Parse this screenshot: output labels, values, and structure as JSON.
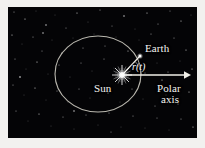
{
  "figure": {
    "background_color": "#040406",
    "frame_color": "#f2f1ef",
    "orbit_color": "#b9b7ae",
    "line_color": "#f0efe8",
    "star_color": "#ffffff"
  },
  "labels": {
    "earth": "Earth",
    "sun": "Sun",
    "polar": "Polar",
    "axis": "axis",
    "radius": "r(t)"
  },
  "geometry": {
    "orbit": {
      "cx": 90,
      "cy": 67,
      "rx": 43,
      "ry": 38
    },
    "sun": {
      "x": 114,
      "y": 68
    },
    "earth": {
      "x": 132,
      "y": 49
    },
    "polar_axis": {
      "x1": 114,
      "y1": 68,
      "x2": 180,
      "y2": 68
    }
  },
  "icons": {
    "sun": "sun-starburst-icon",
    "earth": "earth-dot-icon",
    "arrow": "arrow-right-icon"
  }
}
